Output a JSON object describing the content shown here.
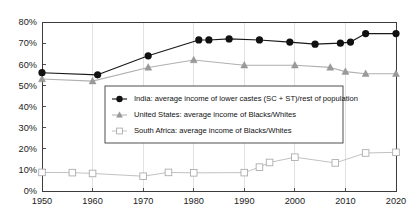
{
  "chart_data": {
    "type": "line",
    "title": "",
    "xlabel": "",
    "ylabel": "",
    "xlim": [
      1950,
      2020
    ],
    "ylim": [
      0,
      80
    ],
    "grid": true,
    "legend_position": "center-left",
    "x_ticks": [
      "1950",
      "1960",
      "1970",
      "1980",
      "1990",
      "2000",
      "2010",
      "2020"
    ],
    "x_tick_values": [
      1950,
      1960,
      1970,
      1980,
      1990,
      2000,
      2010,
      2020
    ],
    "y_ticks": [
      "0%",
      "10%",
      "20%",
      "30%",
      "40%",
      "50%",
      "60%",
      "70%",
      "80%"
    ],
    "y_tick_values": [
      0,
      10,
      20,
      30,
      40,
      50,
      60,
      70,
      80
    ],
    "series": [
      {
        "name": "India: average income of lower castes (SC + ST)/rest of population",
        "short_name": "India",
        "marker": "filled-circle",
        "color": "#111111",
        "line_color": "#1a1a1a",
        "x": [
          1950,
          1961,
          1971,
          1981,
          1983,
          1987,
          1993,
          1999,
          2004,
          2009,
          2011,
          2014,
          2020
        ],
        "values": [
          56.0,
          55.0,
          64.0,
          71.5,
          71.5,
          72.0,
          71.5,
          70.5,
          69.5,
          70.0,
          70.5,
          74.5,
          74.5
        ]
      },
      {
        "name": "United States: average income of Blacks/Whites",
        "short_name": "United States",
        "marker": "filled-triangle",
        "color": "#9a9a9a",
        "line_color": "#b0b0b0",
        "x": [
          1950,
          1960,
          1971,
          1980,
          1990,
          2000,
          2007,
          2010,
          2014,
          2020
        ],
        "values": [
          53.0,
          52.0,
          58.5,
          62.0,
          59.5,
          59.5,
          58.5,
          56.5,
          55.5,
          55.5
        ]
      },
      {
        "name": "South Africa: average income of Blacks/Whites",
        "short_name": "South Africa",
        "marker": "open-square",
        "color": "#ffffff",
        "line_color": "#c2c2c2",
        "x": [
          1950,
          1956,
          1960,
          1970,
          1975,
          1980,
          1990,
          1993,
          1995,
          2000,
          2008,
          2014,
          2020
        ],
        "values": [
          8.8,
          8.7,
          8.3,
          7.0,
          8.8,
          8.6,
          8.7,
          11.3,
          13.5,
          16.0,
          13.3,
          18.0,
          18.3
        ]
      }
    ]
  },
  "legend": {
    "entries": [
      "India: average income of lower castes (SC + ST)/rest of population",
      "United States: average income of Blacks/Whites",
      "South Africa: average income of Blacks/Whites"
    ]
  },
  "axis": {
    "y_labels": [
      "80%",
      "70%",
      "60%",
      "50%",
      "40%",
      "30%",
      "20%",
      "10%",
      "0%"
    ],
    "x_labels": [
      "1950",
      "1960",
      "1970",
      "1980",
      "1990",
      "2000",
      "2010",
      "2020"
    ]
  },
  "colors": {
    "india": "#111111",
    "united_states": "#9a9a9a",
    "south_africa": "#c2c2c2",
    "axis": "#3c3c3c",
    "grid": "#d6d6d6",
    "background": "#ffffff"
  }
}
